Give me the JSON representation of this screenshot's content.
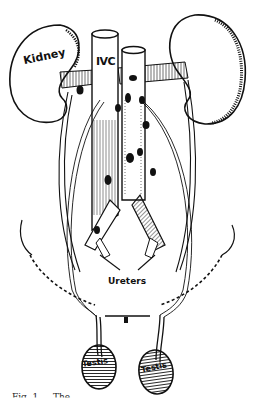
{
  "figure": {
    "type": "anatomical line illustration",
    "labels": {
      "kidney": "Kidney",
      "ivc": "IVC",
      "ureters": "Ureters",
      "testis_left": "Testis",
      "testis_right": "Testis"
    },
    "caption_partial": "Fig. 1__. The ..."
  },
  "colors": {
    "ink": "#111111",
    "background": "#ffffff"
  }
}
